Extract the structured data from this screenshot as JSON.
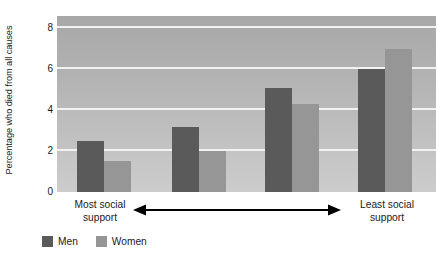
{
  "chart_data": {
    "type": "bar",
    "title": "",
    "subtitle": "",
    "xlabel": "",
    "ylabel": "Percentage who died from all causes",
    "ylim": [
      0,
      8.6
    ],
    "yticks": [
      0,
      2,
      4,
      6,
      8
    ],
    "ytick_labels": [
      "0",
      "2",
      "4",
      "6",
      "8"
    ],
    "grid": true,
    "grid_axis": "y",
    "legend_position": "bottom-left",
    "categories": [
      "Most social support",
      "2",
      "3",
      "Least social support"
    ],
    "series": [
      {
        "name": "Men",
        "color": "#5a5a5a",
        "values": [
          2.5,
          3.2,
          5.1,
          6.0
        ]
      },
      {
        "name": "Women",
        "color": "#969696",
        "values": [
          1.5,
          2.0,
          4.3,
          7.0
        ]
      }
    ],
    "annotations": [
      {
        "name": "axis-direction-arrow",
        "text": "",
        "style": "double-headed-horizontal-arrow"
      }
    ],
    "axis_endpoints": {
      "left_label_line1": "Most social",
      "left_label_line2": "support",
      "right_label_line1": "Least social",
      "right_label_line2": "support"
    }
  },
  "legend": {
    "items": [
      {
        "label": "Men",
        "color": "#5a5a5a"
      },
      {
        "label": "Women",
        "color": "#969696"
      }
    ]
  },
  "colors": {
    "men": "#5a5a5a",
    "women": "#969696",
    "gridline": "#f2f2f2",
    "text": "#1a1a1a",
    "arrow": "#000000"
  }
}
